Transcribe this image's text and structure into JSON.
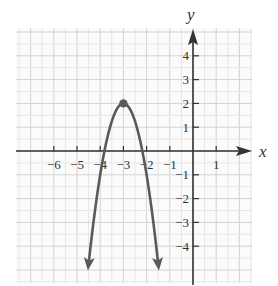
{
  "chart_data": {
    "type": "line",
    "title": "",
    "xlabel": "x",
    "ylabel": "y",
    "xlim": [
      -7.5,
      2.5
    ],
    "ylim": [
      -5.5,
      5.2
    ],
    "grid": true,
    "x_ticks": [
      -6,
      -5,
      -4,
      -3,
      -2,
      -1,
      1
    ],
    "y_ticks": [
      4,
      3,
      2,
      1,
      -1,
      -2,
      -3,
      -4
    ],
    "x_tick_labels": [
      "−6",
      "−5",
      "−4",
      "−3",
      "−2",
      "−1",
      "1"
    ],
    "y_tick_labels": [
      "4",
      "3",
      "2",
      "1",
      "−1",
      "−2",
      "−3",
      "−4"
    ],
    "series": [
      {
        "name": "parabola",
        "equation": "y = -3(x+3)^2 + 2",
        "color": "#5a5a5a",
        "vertex": [
          -3,
          2
        ],
        "x_intercepts": [
          -3.82,
          -2.18
        ],
        "endpoints_arrows": [
          [
            -4.53,
            -5
          ],
          [
            -1.47,
            -5
          ]
        ],
        "points": [
          [
            -4.53,
            -5
          ],
          [
            -4.4,
            -3.88
          ],
          [
            -4.2,
            -2.32
          ],
          [
            -4.0,
            -1
          ],
          [
            -3.82,
            0
          ],
          [
            -3.6,
            0.92
          ],
          [
            -3.4,
            1.52
          ],
          [
            -3.2,
            1.88
          ],
          [
            -3.0,
            2
          ],
          [
            -2.8,
            1.88
          ],
          [
            -2.6,
            1.52
          ],
          [
            -2.4,
            0.92
          ],
          [
            -2.18,
            0
          ],
          [
            -2.0,
            -1
          ],
          [
            -1.8,
            -2.32
          ],
          [
            -1.6,
            -3.88
          ],
          [
            -1.47,
            -5
          ]
        ]
      }
    ],
    "highlighted_points": [
      {
        "label": "vertex",
        "x": -3,
        "y": 2
      }
    ]
  },
  "labels": {
    "x_axis": "x",
    "y_axis": "y"
  },
  "colors": {
    "curve": "#5a5a5a",
    "axis": "#333333",
    "grid": "#d9d9d9"
  }
}
